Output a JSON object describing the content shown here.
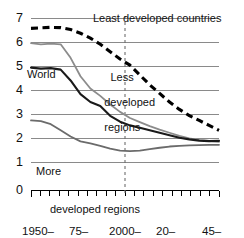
{
  "chart_data": {
    "type": "line",
    "title": "",
    "subtitle": "",
    "xlabel": "",
    "ylabel": "",
    "ylim": [
      0,
      7
    ],
    "yticks": [
      0,
      1,
      2,
      3,
      4,
      5,
      6,
      7
    ],
    "ytick_labels": [
      "0",
      "1",
      "2",
      "3",
      "4",
      "5",
      "6",
      "7"
    ],
    "grid": "horizontal",
    "legend_position": "inline-annotations",
    "x_categories": [
      "1950-55",
      "1955-60",
      "1960-65",
      "1965-70",
      "1970-75",
      "1975-80",
      "1980-85",
      "1985-90",
      "1990-95",
      "1995-2000",
      "2000-05",
      "2005-10",
      "2010-15",
      "2015-20",
      "2020-25",
      "2025-30",
      "2030-35",
      "2035-40",
      "2040-45",
      "2045-50"
    ],
    "xtick_labels": [
      {
        "line1": "1950–",
        "line2": "55"
      },
      {
        "line1": "75–",
        "line2": "80"
      },
      {
        "line1": "2000–",
        "line2": "05"
      },
      {
        "line1": "20–",
        "line2": "25"
      },
      {
        "line1": "45–",
        "line2": "50"
      }
    ],
    "xtick_indices": [
      0,
      5,
      10,
      14,
      19
    ],
    "projection_divider": {
      "at_category": "2000-05",
      "style": "dashed-vertical"
    },
    "series": [
      {
        "name": "Least developed countries",
        "style": "dashed",
        "color": "#000000",
        "values": [
          6.6,
          6.62,
          6.64,
          6.63,
          6.55,
          6.4,
          6.2,
          5.95,
          5.65,
          5.35,
          5.1,
          4.7,
          4.3,
          3.95,
          3.6,
          3.3,
          3.05,
          2.85,
          2.65,
          2.45
        ]
      },
      {
        "name": "Less developed regions",
        "style": "solid",
        "color": "#8c8c8c",
        "values": [
          6.0,
          5.95,
          5.98,
          5.95,
          5.4,
          4.65,
          4.15,
          3.85,
          3.5,
          3.2,
          2.95,
          2.78,
          2.62,
          2.48,
          2.35,
          2.22,
          2.12,
          2.05,
          2.02,
          1.98
        ]
      },
      {
        "name": "World",
        "style": "solid",
        "color": "#1a1a1a",
        "values": [
          5.0,
          4.96,
          4.98,
          4.92,
          4.48,
          3.92,
          3.6,
          3.44,
          3.04,
          2.8,
          2.65,
          2.55,
          2.45,
          2.35,
          2.25,
          2.15,
          2.08,
          2.03,
          2.01,
          2.02
        ]
      },
      {
        "name": "More developed regions",
        "style": "solid",
        "color": "#6b6b6b",
        "values": [
          2.85,
          2.82,
          2.7,
          2.45,
          2.2,
          2.0,
          1.92,
          1.82,
          1.7,
          1.62,
          1.6,
          1.62,
          1.68,
          1.74,
          1.79,
          1.82,
          1.84,
          1.85,
          1.86,
          1.86
        ]
      }
    ],
    "annotations": [
      {
        "name": "least-developed-countries-label",
        "text": "Least developed countries"
      },
      {
        "name": "less-developed-regions-label",
        "text": "Less\ndeveloped\nregions",
        "line1": "Less",
        "line2": "developed",
        "line3": "regions"
      },
      {
        "name": "world-label",
        "text": "World"
      },
      {
        "name": "more-developed-regions-label",
        "line1": "More",
        "line2": "developed regions"
      }
    ]
  },
  "colors": {
    "gridline": "#8a8a8a",
    "axis": "#000000",
    "least_developed": "#000000",
    "less_developed": "#8c8c8c",
    "world": "#1a1a1a",
    "more_developed": "#6b6b6b",
    "divider": "#6e6e6e",
    "background": "#ffffff"
  }
}
